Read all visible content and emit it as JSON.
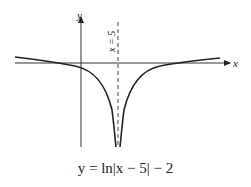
{
  "figure": {
    "y_axis_label": "y",
    "x_axis_label": "x",
    "asymptote_label": "x = 5",
    "caption": "y = ln|x − 5| − 2",
    "function": "ln|x-5|-2",
    "asymptote_x": 5,
    "x_intercepts": [
      "5 - e^2",
      "5 + e^2"
    ],
    "colors": {
      "ink": "#222222",
      "background": "#ffffff"
    }
  }
}
